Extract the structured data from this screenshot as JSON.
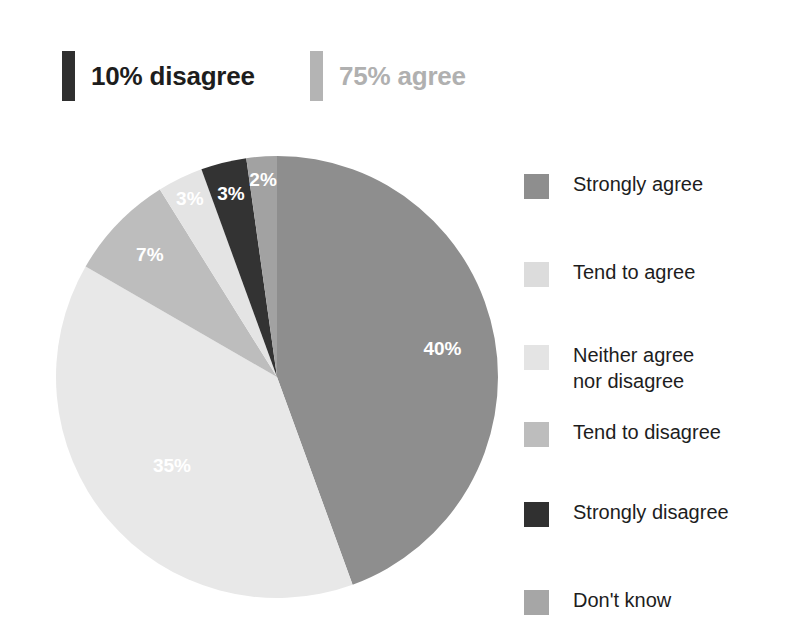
{
  "header": {
    "callouts": [
      {
        "name": "disagree",
        "label": "10% disagree",
        "color": "#2f2f2f",
        "text_color": "#1d1d1d"
      },
      {
        "name": "agree",
        "label": "75% agree",
        "color": "#b4b4b4",
        "text_color": "#b0b0b0"
      }
    ]
  },
  "legend": {
    "items": [
      {
        "label": "Strongly agree",
        "color": "#8e8e8e"
      },
      {
        "label": "Tend to agree",
        "color": "#dcdcdc"
      },
      {
        "label": "Neither agree\nnor disagree",
        "color": "#e4e4e4"
      },
      {
        "label": "Tend to disagree",
        "color": "#bdbdbd"
      },
      {
        "label": "Strongly disagree",
        "color": "#303030"
      },
      {
        "label": "Don't know",
        "color": "#a6a6a6"
      }
    ]
  },
  "chart_data": {
    "type": "pie",
    "title": "",
    "labels": [
      "Strongly agree",
      "Tend to agree",
      "Tend to disagree",
      "Neither agree nor disagree",
      "Strongly disagree",
      "Don't know"
    ],
    "values": [
      40,
      35,
      7,
      3,
      3,
      2
    ],
    "value_labels": [
      "40%",
      "35%",
      "7%",
      "3%",
      "3%",
      "2%"
    ],
    "colors": [
      "#8e8e8e",
      "#e8e8e8",
      "#bdbdbd",
      "#e4e4e4",
      "#333333",
      "#a2a2a2"
    ],
    "units": "percent",
    "start_angle_deg": 0,
    "direction": "clockwise",
    "legend_position": "right",
    "grid": false,
    "annotations": [
      "10% disagree",
      "75% agree"
    ]
  }
}
